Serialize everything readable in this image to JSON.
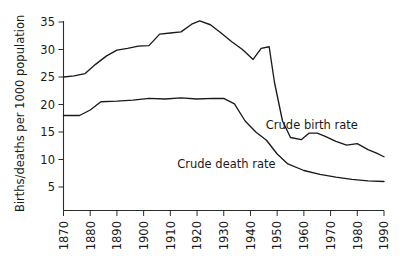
{
  "chart_data": {
    "type": "line",
    "title": "",
    "xlabel": "",
    "ylabel": "Births/deaths per 1000 population",
    "xlim": [
      1870,
      1990
    ],
    "ylim": [
      0,
      35
    ],
    "grid": false,
    "legend_position": "inline-annotations",
    "xticks": [
      "1870",
      "1880",
      "1890",
      "1900",
      "1910",
      "1920",
      "1930",
      "1940",
      "1950",
      "1960",
      "1970",
      "1980",
      "1990"
    ],
    "yticks": [
      "5",
      "10",
      "15",
      "20",
      "25",
      "30",
      "35"
    ],
    "annotations": [
      {
        "text": "Crude birth rate",
        "x": 1963,
        "y": 15.5
      },
      {
        "text": "Crude death rate",
        "x": 1931,
        "y": 8.4
      }
    ],
    "series": [
      {
        "name": "Crude birth rate",
        "x": [
          1870,
          1874,
          1878,
          1882,
          1886,
          1890,
          1894,
          1898,
          1902,
          1906,
          1910,
          1914,
          1918,
          1921,
          1925,
          1929,
          1933,
          1937,
          1941,
          1944,
          1947,
          1949,
          1952,
          1955,
          1959,
          1962,
          1965,
          1968,
          1972,
          1976,
          1980,
          1984,
          1987,
          1990
        ],
        "y": [
          25.0,
          25.2,
          25.6,
          27.3,
          28.8,
          29.9,
          30.2,
          30.6,
          30.7,
          32.8,
          33.0,
          33.2,
          34.6,
          35.2,
          34.5,
          33.0,
          31.4,
          30.0,
          28.2,
          30.2,
          30.5,
          24.0,
          17.0,
          14.0,
          13.6,
          14.8,
          14.8,
          14.2,
          13.3,
          12.6,
          12.9,
          11.8,
          11.2,
          10.5
        ]
      },
      {
        "name": "Crude death rate",
        "x": [
          1870,
          1876,
          1880,
          1884,
          1890,
          1896,
          1902,
          1908,
          1914,
          1920,
          1926,
          1930,
          1934,
          1938,
          1942,
          1946,
          1950,
          1954,
          1960,
          1966,
          1972,
          1978,
          1984,
          1990
        ],
        "y": [
          18.0,
          18.0,
          19.0,
          20.5,
          20.6,
          20.8,
          21.1,
          21.0,
          21.2,
          21.0,
          21.1,
          21.1,
          20.1,
          17.0,
          15.0,
          13.5,
          11.0,
          9.2,
          8.0,
          7.3,
          6.8,
          6.4,
          6.1,
          6.0
        ]
      }
    ]
  }
}
